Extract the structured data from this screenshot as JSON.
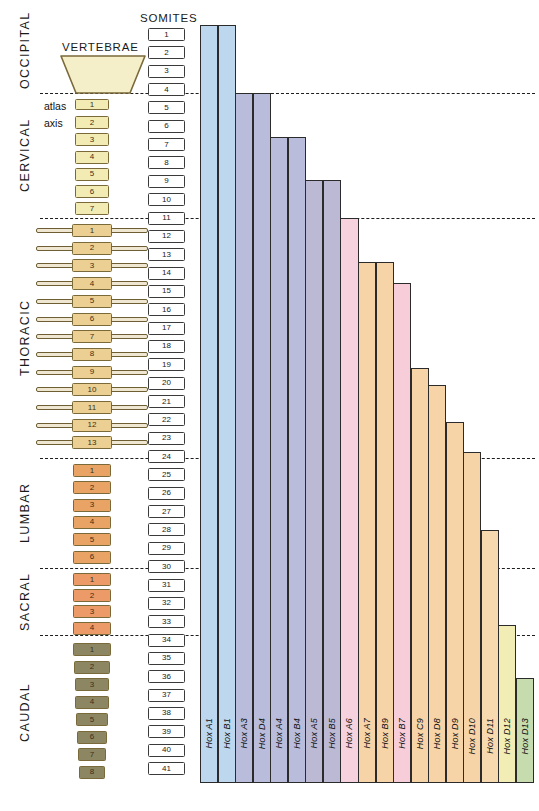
{
  "headings": {
    "vertebrae": "VERTEBRAE",
    "somites": "SOMITES"
  },
  "regions": [
    {
      "name": "OCCIPITAL",
      "label": "OCCIPITAL",
      "top": 12,
      "bottom": 93
    },
    {
      "name": "CERVICAL",
      "label": "CERVICAL",
      "top": 93,
      "bottom": 218
    },
    {
      "name": "THORACIC",
      "label": "THORACIC",
      "top": 218,
      "bottom": 458
    },
    {
      "name": "LUMBAR",
      "label": "LUMBAR",
      "top": 458,
      "bottom": 568
    },
    {
      "name": "SACRAL",
      "label": "SACRAL",
      "top": 568,
      "bottom": 635
    },
    {
      "name": "CAUDAL",
      "label": "CAUDAL",
      "top": 635,
      "bottom": 790
    }
  ],
  "boundary_lines": [
    93,
    218,
    458,
    568,
    635
  ],
  "special_labels": [
    {
      "text": "atlas",
      "vertebra": "cervical-1"
    },
    {
      "text": "axis",
      "vertebra": "cervical-2"
    }
  ],
  "vertebrae": {
    "occipital": {
      "label": "",
      "count": 1,
      "shape": "trapezoid",
      "color": "#f4efc8"
    },
    "cervical": {
      "labels": [
        "1",
        "2",
        "3",
        "4",
        "5",
        "6",
        "7"
      ],
      "color": "#f2ecb4"
    },
    "thoracic": {
      "labels": [
        "1",
        "2",
        "3",
        "4",
        "5",
        "6",
        "7",
        "8",
        "9",
        "10",
        "11",
        "12",
        "13"
      ],
      "color": "#eccf92",
      "has_ribs": true
    },
    "lumbar": {
      "labels": [
        "1",
        "2",
        "3",
        "4",
        "5",
        "6"
      ],
      "color": "#e8a365"
    },
    "sacral": {
      "labels": [
        "1",
        "2",
        "3",
        "4"
      ],
      "color": "#ec9a68"
    },
    "caudal": {
      "labels": [
        "1",
        "2",
        "3",
        "4",
        "5",
        "6",
        "7",
        "8"
      ],
      "color": "#8d8663"
    }
  },
  "somites": {
    "labels": [
      "1",
      "2",
      "3",
      "4",
      "5",
      "6",
      "7",
      "8",
      "9",
      "10",
      "11",
      "12",
      "13",
      "14",
      "15",
      "16",
      "17",
      "18",
      "19",
      "20",
      "21",
      "22",
      "23",
      "24",
      "25",
      "26",
      "27",
      "28",
      "29",
      "30",
      "31",
      "32",
      "33",
      "34",
      "35",
      "36",
      "37",
      "38",
      "39",
      "40",
      "41"
    ],
    "count": 41
  },
  "chart_data": {
    "type": "bar",
    "xlabel": "",
    "ylabel": "",
    "orientation": "vertical-anterior-limit",
    "categories": [
      "Hox A1",
      "Hox B1",
      "Hox A3",
      "Hox D4",
      "Hox A4",
      "Hox B4",
      "Hox A5",
      "Hox B5",
      "Hox A6",
      "Hox A7",
      "Hox B9",
      "Hox B7",
      "Hox C9",
      "Hox D8",
      "Hox D9",
      "Hox D10",
      "Hox D11",
      "Hox D12",
      "Hox D13"
    ],
    "values": [
      100.0,
      100.0,
      89.5,
      89.5,
      83.5,
      83.5,
      77.8,
      77.8,
      73.5,
      67.7,
      67.7,
      64.9,
      51.1,
      48.8,
      43.9,
      39.9,
      29.5,
      20.6,
      14.3
    ],
    "value_units": "percent of axis length expressed (anterior boundary position)",
    "anterior_boundary_px": [
      25,
      25,
      93,
      93,
      137,
      137,
      180,
      180,
      218,
      262,
      262,
      283,
      368,
      385,
      422,
      452,
      530,
      625,
      678
    ],
    "baseline_px": 783,
    "colors": [
      "#bdd7ee",
      "#bdd7ee",
      "#b9bddb",
      "#b9bddb",
      "#b9bddb",
      "#b9bddb",
      "#bcb9d4",
      "#bcb9d4",
      "#f5d2dd",
      "#f7d3a8",
      "#f7d3a8",
      "#f7cdd9",
      "#f7d3a8",
      "#f7d3a8",
      "#f7d3a8",
      "#f7d3a8",
      "#f7d9b0",
      "#f2edb4",
      "#c6dcae"
    ],
    "boundary_region_labels": [
      "OCCIPITAL",
      "CERVICAL",
      "THORACIC",
      "LUMBAR",
      "SACRAL",
      "CAUDAL"
    ],
    "grid": false,
    "legend": "none"
  }
}
